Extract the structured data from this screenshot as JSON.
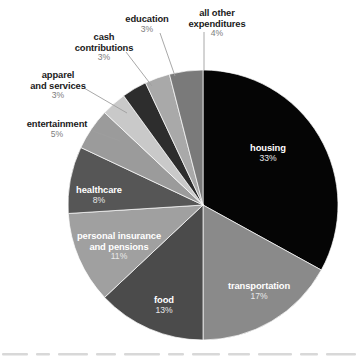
{
  "chart_data": {
    "type": "pie",
    "title": "",
    "subtitle": "",
    "xlabel": "",
    "ylabel": "",
    "legend_position": "none",
    "grid": false,
    "units": "percent",
    "start_angle_deg": 0,
    "direction": "clockwise",
    "total": 100,
    "categories": [
      "housing",
      "transportation",
      "food",
      "personal insurance and pensions",
      "healthcare",
      "entertainment",
      "apparel and services",
      "cash contributions",
      "education",
      "all other expenditures"
    ],
    "values": [
      33,
      17,
      13,
      11,
      8,
      5,
      3,
      3,
      3,
      4
    ],
    "slices": [
      {
        "label": "housing",
        "label_line1": "housing",
        "label_line2": "",
        "value": 33,
        "pct_text": "33%",
        "color": "#050505",
        "label_placement": "inside"
      },
      {
        "label": "transportation",
        "label_line1": "transportation",
        "label_line2": "",
        "value": 17,
        "pct_text": "17%",
        "color": "#8a8a8a",
        "label_placement": "inside"
      },
      {
        "label": "food",
        "label_line1": "food",
        "label_line2": "",
        "value": 13,
        "pct_text": "13%",
        "color": "#4b4b4b",
        "label_placement": "inside"
      },
      {
        "label": "personal insurance and pensions",
        "label_line1": "personal insurance",
        "label_line2": "and pensions",
        "value": 11,
        "pct_text": "11%",
        "color": "#a0a0a0",
        "label_placement": "inside"
      },
      {
        "label": "healthcare",
        "label_line1": "healthcare",
        "label_line2": "",
        "value": 8,
        "pct_text": "8%",
        "color": "#565656",
        "label_placement": "inside"
      },
      {
        "label": "entertainment",
        "label_line1": "entertainment",
        "label_line2": "",
        "value": 5,
        "pct_text": "5%",
        "color": "#9b9b9b",
        "label_placement": "outside"
      },
      {
        "label": "apparel and services",
        "label_line1": "apparel",
        "label_line2": "and services",
        "value": 3,
        "pct_text": "3%",
        "color": "#c9c9c9",
        "label_placement": "outside"
      },
      {
        "label": "cash contributions",
        "label_line1": "cash",
        "label_line2": "contributions",
        "value": 3,
        "pct_text": "3%",
        "color": "#2d2d2d",
        "label_placement": "outside"
      },
      {
        "label": "education",
        "label_line1": "education",
        "label_line2": "",
        "value": 3,
        "pct_text": "3%",
        "color": "#a9a9a9",
        "label_placement": "outside"
      },
      {
        "label": "all other expenditures",
        "label_line1": "all other",
        "label_line2": "expenditures",
        "value": 4,
        "pct_text": "4%",
        "color": "#7a7a7a",
        "label_placement": "outside"
      }
    ],
    "geometry": {
      "center_x": 203,
      "center_y": 205,
      "radius": 135
    },
    "label_positions": [
      {
        "x": 268,
        "y": 143,
        "anchor": "center"
      },
      {
        "x": 259,
        "y": 281,
        "anchor": "center"
      },
      {
        "x": 164,
        "y": 295,
        "anchor": "center"
      },
      {
        "x": 119,
        "y": 231,
        "anchor": "center"
      },
      {
        "x": 99,
        "y": 185,
        "anchor": "center"
      },
      {
        "x": 57,
        "y": 119,
        "anchor": "center"
      },
      {
        "x": 58,
        "y": 70,
        "anchor": "center"
      },
      {
        "x": 104,
        "y": 32,
        "anchor": "center"
      },
      {
        "x": 147,
        "y": 14,
        "anchor": "center"
      },
      {
        "x": 217,
        "y": 8,
        "anchor": "center"
      }
    ],
    "leader_lines": [
      {
        "from_x": 93,
        "from_y": 131,
        "to_x": 120,
        "to_y": 141,
        "for": "entertainment"
      },
      {
        "from_x": 84,
        "from_y": 88,
        "to_x": 127,
        "to_y": 113,
        "for": "apparel and services"
      },
      {
        "from_x": 126,
        "from_y": 52,
        "to_x": 152,
        "to_y": 86,
        "for": "cash contributions"
      },
      {
        "from_x": 160,
        "from_y": 33,
        "to_x": 175,
        "to_y": 76,
        "for": "education"
      },
      {
        "from_x": 204,
        "from_y": 32,
        "to_x": 204,
        "to_y": 70,
        "for": "all other expenditures"
      }
    ],
    "colors": {
      "background": "#ffffff",
      "label_text": "#1a1a1a",
      "label_pct_text": "#7d7d7d",
      "inside_label_text": "#ffffff",
      "leader_line": "#9e9e9e"
    }
  }
}
